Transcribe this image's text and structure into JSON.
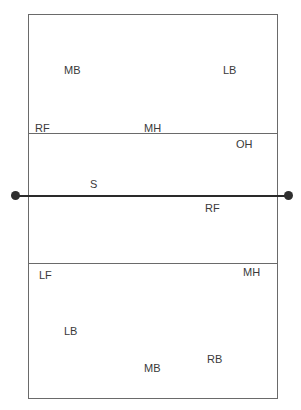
{
  "diagram": {
    "title": "",
    "colors": {
      "line": "#6a6a6a",
      "net": "#2a2a2a",
      "text": "#3a3a3a"
    },
    "top_half": {
      "players": [
        {
          "label": "MB",
          "x": 64,
          "y": 64
        },
        {
          "label": "LB",
          "x": 223,
          "y": 64
        },
        {
          "label": "RF",
          "x": 35,
          "y": 122
        },
        {
          "label": "MH",
          "x": 144,
          "y": 122
        }
      ]
    },
    "center": {
      "players": [
        {
          "label": "OH",
          "x": 236,
          "y": 138
        },
        {
          "label": "S",
          "x": 90,
          "y": 178
        },
        {
          "label": "RF",
          "x": 205,
          "y": 202
        }
      ]
    },
    "bottom_half": {
      "players": [
        {
          "label": "LF",
          "x": 39,
          "y": 269
        },
        {
          "label": "MH",
          "x": 243,
          "y": 266
        },
        {
          "label": "LB",
          "x": 64,
          "y": 325
        },
        {
          "label": "MB",
          "x": 144,
          "y": 362
        },
        {
          "label": "RB",
          "x": 207,
          "y": 353
        }
      ]
    }
  }
}
